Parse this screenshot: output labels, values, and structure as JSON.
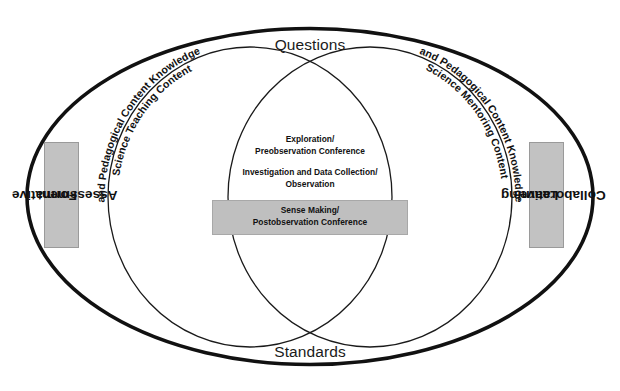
{
  "diagram": {
    "type": "venn",
    "outer_label_top": "Questions",
    "outer_label_bottom": "Standards",
    "left_side_label": "Formative\nAssessment",
    "left_side_label_line1": "Formative",
    "left_side_label_line2": "Assessment",
    "right_side_label_line1": "Collaborative",
    "right_side_label_line2": "Learning",
    "left_circle_label_line1": "Science Teaching Content",
    "left_circle_label_line2": "and Pedagogical Content Knowledge",
    "right_circle_label_line1": "Science Mentoring Content",
    "right_circle_label_line2": "and Pedagogical Content Knowledge",
    "center_items": [
      {
        "line1": "Exploration/",
        "line2": "Preobservation Conference",
        "highlighted": false
      },
      {
        "line1": "Investigation and Data Collection/",
        "line2": "Observation",
        "highlighted": false
      },
      {
        "line1": "Sense Making/",
        "line2": "Postobservation Conference",
        "highlighted": true
      }
    ],
    "colors": {
      "stroke": "#111111",
      "shaded_box": "#c2c2c2",
      "background": "#ffffff"
    }
  }
}
